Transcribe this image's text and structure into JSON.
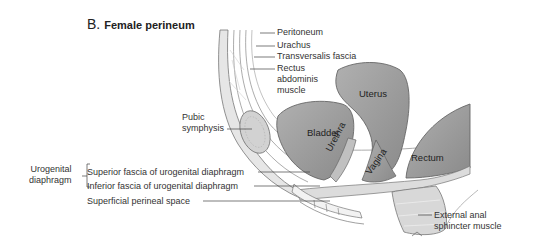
{
  "figure": {
    "letter": "B.",
    "title": "Female perineum"
  },
  "labels": {
    "peritoneum": "Peritoneum",
    "urachus": "Urachus",
    "transversalis_fascia": "Transversalis fascia",
    "rectus_line1": "Rectus",
    "rectus_line2": "abdominis",
    "rectus_line3": "muscle",
    "pubic_line1": "Pubic",
    "pubic_line2": "symphysis",
    "urogenital_line1": "Urogenital",
    "urogenital_line2": "diaphragm",
    "superior_fascia": "Superior fascia of urogenital diaphragm",
    "inferior_fascia": "Inferior fascia of urogenital diaphragm",
    "superficial_space": "Superficial perineal space",
    "external_anal_line1": "External anal",
    "external_anal_line2": "sphincter muscle"
  },
  "organs": {
    "uterus": "Uterus",
    "bladder": "Bladder",
    "urethra": "Urethra",
    "vagina": "Vagina",
    "rectum": "Rectum"
  },
  "colors": {
    "organ_fill": "#9a9a9a",
    "tissue_fill": "#e2e2e2",
    "outline": "#6a6a6a",
    "leader_line": "#444444"
  }
}
